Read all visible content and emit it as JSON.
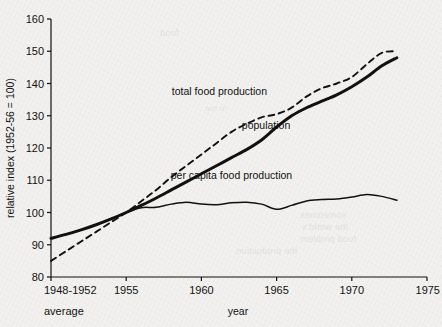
{
  "figure": {
    "background_color": "#f2f1ef",
    "ink_color": "#111111"
  },
  "chart_data": {
    "type": "line",
    "title": "",
    "xlabel": "year",
    "ylabel": "relative index (1952-56 = 100)",
    "xlim": [
      1950,
      1975
    ],
    "ylim": [
      80,
      160
    ],
    "grid": false,
    "legend_position": "inline-annotations",
    "x_tick_labels": [
      "1948-1952",
      "1955",
      "1960",
      "1965",
      "1970",
      "1975"
    ],
    "x_tick_values": [
      1950,
      1955,
      1960,
      1965,
      1970,
      1975
    ],
    "x_tick_sublabel": "average",
    "y_tick_labels": [
      "80",
      "90",
      "100",
      "110",
      "120",
      "130",
      "140",
      "150",
      "160"
    ],
    "y_tick_values": [
      80,
      90,
      100,
      110,
      120,
      130,
      140,
      150,
      160
    ],
    "series": [
      {
        "name": "total food production",
        "style": "dashed",
        "label_x": 1961.2,
        "label_y": 136.5,
        "x": [
          1950,
          1951,
          1952,
          1953,
          1954,
          1955,
          1956,
          1957,
          1958,
          1959,
          1960,
          1961,
          1962,
          1963,
          1964,
          1965,
          1966,
          1967,
          1968,
          1969,
          1970,
          1971,
          1972,
          1973
        ],
        "values": [
          85.0,
          88.0,
          91.0,
          94.0,
          97.0,
          100.0,
          103.5,
          107.0,
          111.0,
          114.5,
          118.0,
          121.5,
          125.0,
          127.5,
          129.5,
          130.5,
          132.5,
          136.0,
          138.5,
          140.0,
          142.0,
          146.0,
          149.5,
          150.0
        ]
      },
      {
        "name": "population",
        "style": "solid-thick",
        "label_x": 1964.3,
        "label_y": 126.0,
        "x": [
          1950,
          1951,
          1952,
          1953,
          1954,
          1955,
          1956,
          1957,
          1958,
          1959,
          1960,
          1961,
          1962,
          1963,
          1964,
          1965,
          1966,
          1967,
          1968,
          1969,
          1970,
          1971,
          1972,
          1973
        ],
        "values": [
          92.0,
          93.2,
          94.6,
          96.2,
          98.0,
          100.0,
          102.2,
          104.5,
          107.0,
          109.5,
          112.0,
          114.5,
          117.0,
          119.5,
          122.5,
          126.5,
          130.0,
          132.5,
          134.5,
          136.5,
          139.0,
          142.0,
          145.5,
          148.0
        ]
      },
      {
        "name": "per capita food production",
        "style": "solid-thin",
        "label_x": 1962.0,
        "label_y": 110.5,
        "x": [
          1950,
          1951,
          1952,
          1953,
          1954,
          1955,
          1956,
          1957,
          1958,
          1959,
          1960,
          1961,
          1962,
          1963,
          1964,
          1965,
          1966,
          1967,
          1968,
          1969,
          1970,
          1971,
          1972,
          1973
        ],
        "values": [
          92.0,
          93.2,
          94.6,
          96.2,
          98.0,
          100.0,
          101.5,
          101.6,
          102.6,
          103.2,
          102.6,
          102.4,
          103.0,
          103.2,
          102.6,
          101.0,
          102.2,
          103.6,
          104.0,
          104.2,
          104.8,
          105.6,
          105.0,
          103.8
        ]
      }
    ]
  },
  "bleed_through": [
    {
      "text": "sometimes",
      "x": 300,
      "y": 210,
      "size": 9
    },
    {
      "text": "the world's",
      "x": 302,
      "y": 222,
      "size": 9
    },
    {
      "text": "food problem",
      "x": 300,
      "y": 234,
      "size": 9
    },
    {
      "text": "the production",
      "x": 236,
      "y": 246,
      "size": 9
    },
    {
      "text": "food",
      "x": 160,
      "y": 28,
      "size": 9
    },
    {
      "text": "in the",
      "x": 205,
      "y": 104,
      "size": 8
    }
  ]
}
